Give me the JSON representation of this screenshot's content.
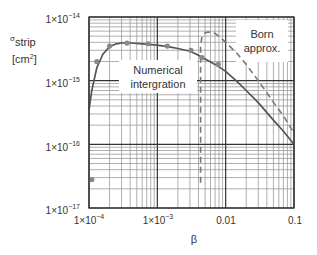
{
  "chart_data": {
    "type": "line",
    "title": "",
    "xlabel": "β",
    "ylabel": "σ_strip [cm²]",
    "ylabel_main": "σ",
    "ylabel_sub": "strip",
    "ylabel_unit": "[cm",
    "ylabel_unit_sup": "2",
    "ylabel_unit_close": "]",
    "xscale": "log",
    "yscale": "log",
    "xlim": [
      0.0001,
      0.1
    ],
    "ylim": [
      1e-17,
      1e-14
    ],
    "grid": true,
    "x_ticks": [
      {
        "value": 0.0001,
        "base": "1×10",
        "exp": "−4"
      },
      {
        "value": 0.001,
        "base": "1×10",
        "exp": "−3"
      },
      {
        "value": 0.01,
        "base": "0.01",
        "exp": ""
      },
      {
        "value": 0.1,
        "base": "0.1",
        "exp": ""
      }
    ],
    "y_ticks": [
      {
        "value": 1e-14,
        "base": "1×10",
        "exp": "−14"
      },
      {
        "value": 1e-15,
        "base": "1×10",
        "exp": "−15"
      },
      {
        "value": 1e-16,
        "base": "1×10",
        "exp": "−16"
      },
      {
        "value": 1e-17,
        "base": "1×10",
        "exp": "−17"
      }
    ],
    "annotations": [
      {
        "text_lines": [
          "Numerical",
          "intergration"
        ],
        "x": 0.00045,
        "y": 9e-16
      },
      {
        "text_lines": [
          "Born",
          "approx."
        ],
        "x": 0.03,
        "y": 4e-15
      }
    ],
    "series": [
      {
        "name": "Numerical intergration",
        "style": "solid",
        "color": "#555555",
        "x": [
          0.0001,
          0.00011,
          0.00013,
          0.00016,
          0.0002,
          0.00025,
          0.0003,
          0.0004,
          0.0006,
          0.001,
          0.0015,
          0.002,
          0.003,
          0.004,
          0.005,
          0.007,
          0.01,
          0.015,
          0.02,
          0.03,
          0.05,
          0.07,
          0.1
        ],
        "y": [
          3.5e-16,
          7e-16,
          1.6e-15,
          2.6e-15,
          3.4e-15,
          3.8e-15,
          3.9e-15,
          3.9e-15,
          3.8e-15,
          3.6e-15,
          3.4e-15,
          3.2e-15,
          2.9e-15,
          2.5e-15,
          2.2e-15,
          1.8e-15,
          1.4e-15,
          9.5e-16,
          7e-16,
          4.5e-16,
          2.4e-16,
          1.6e-16,
          1e-16
        ]
      },
      {
        "name": "Born approx.",
        "style": "dashed",
        "color": "#777777",
        "x": [
          0.0043,
          0.0043,
          0.0045,
          0.005,
          0.0055,
          0.006,
          0.007,
          0.008,
          0.01,
          0.015,
          0.02,
          0.03,
          0.05,
          0.07,
          0.1
        ],
        "y": [
          2.5e-17,
          3.5e-15,
          5e-15,
          5.6e-15,
          5.8e-15,
          5.8e-15,
          5.5e-15,
          5e-15,
          4e-15,
          2.6e-15,
          1.8e-15,
          1e-15,
          4.6e-16,
          2.8e-16,
          1.5e-16
        ]
      },
      {
        "name": "data points",
        "style": "markers",
        "color": "#888888",
        "x": [
          0.00011,
          0.00013,
          0.0002,
          0.00036,
          0.00073,
          0.0014,
          0.0031,
          0.0045,
          0.0078
        ],
        "y": [
          2.8e-17,
          2e-15,
          3.5e-15,
          3.9e-15,
          3.8e-15,
          3.5e-15,
          3e-15,
          2.3e-15,
          1.8e-15
        ]
      }
    ]
  },
  "colors": {
    "grid_minor": "#9a9a9a",
    "grid_major": "#333333",
    "solid_line": "#555555",
    "dashed_line": "#777777",
    "marker": "#888888",
    "label_box": "#ffffff"
  }
}
